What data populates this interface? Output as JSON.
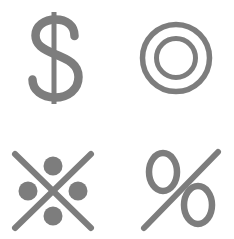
{
  "page": {
    "background_color": "#ffffff",
    "stroke_color": "#7d7d7d",
    "width": 234,
    "height": 239
  },
  "grid": {
    "columns": 2,
    "rows": 2,
    "cells": [
      {
        "id": "dollar-sign",
        "icon_name": "dollar-sign-icon",
        "label": "Dollar Sign",
        "symbol": "$",
        "position": "top-left",
        "style": "outline-serif",
        "color": "#7d7d7d"
      },
      {
        "id": "concentric-circles",
        "icon_name": "concentric-circles-icon",
        "label": "Concentric Circles",
        "symbol": "◎",
        "position": "top-right",
        "style": "stroke",
        "color": "#7d7d7d",
        "outer_diameter": 72,
        "inner_diameter": 40,
        "stroke_width": 5
      },
      {
        "id": "cross-dots",
        "icon_name": "cross-with-dots-icon",
        "label": "Cross With Four Dots",
        "symbol": "※",
        "position": "bottom-left",
        "style": "stroke-and-fill",
        "color": "#7d7d7d",
        "dot_count": 4,
        "dot_diameter": 19,
        "stroke_width": 6
      },
      {
        "id": "percent-sign",
        "icon_name": "percent-sign-icon",
        "label": "Percent Sign",
        "symbol": "%",
        "position": "bottom-right",
        "style": "outline-serif",
        "color": "#7d7d7d"
      }
    ]
  }
}
